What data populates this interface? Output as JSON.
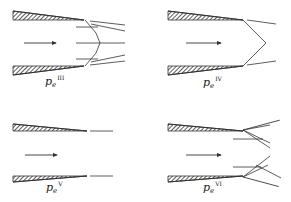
{
  "figure": {
    "panels": [
      {
        "id": "III",
        "label": {
          "symbol": "p",
          "subscript": "e",
          "superscript": "III"
        },
        "regime": "normal shock with oblique shocks at exit"
      },
      {
        "id": "IV",
        "label": {
          "symbol": "p",
          "subscript": "e",
          "superscript": "IV"
        },
        "regime": "oblique shocks meeting at centerline"
      },
      {
        "id": "V",
        "label": {
          "symbol": "p",
          "subscript": "e",
          "superscript": "V"
        },
        "regime": "design condition, parallel exit flow"
      },
      {
        "id": "VI",
        "label": {
          "symbol": "p",
          "subscript": "e",
          "superscript": "VI"
        },
        "regime": "expansion waves at exit"
      }
    ],
    "colors": {
      "line": "#333333",
      "hatch": "#333333",
      "background": "#ffffff"
    }
  }
}
